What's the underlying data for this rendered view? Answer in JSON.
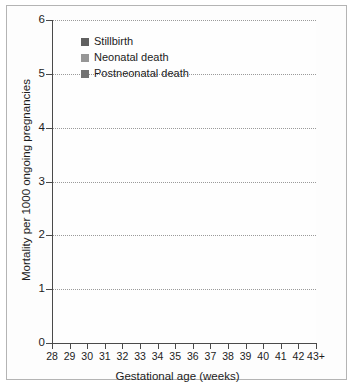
{
  "chart_data": {
    "type": "area",
    "stacked": true,
    "title": "",
    "xlabel": "Gestational age (weeks)",
    "ylabel": "Mortality per 1000 ongoing pregnancies",
    "categories": [
      "28",
      "29",
      "30",
      "31",
      "32",
      "33",
      "34",
      "35",
      "36",
      "37",
      "38",
      "39",
      "40",
      "41",
      "42",
      "43+"
    ],
    "x_tick_labels": [
      "28",
      "29",
      "30",
      "31",
      "32",
      "33",
      "34",
      "35",
      "36",
      "37",
      "38",
      "39",
      "40",
      "41",
      "42",
      "43+"
    ],
    "y_tick_labels": [
      "0",
      "1",
      "2",
      "3",
      "4",
      "5",
      "6"
    ],
    "y_ticks": [
      0,
      1,
      2,
      3,
      4,
      5,
      6
    ],
    "ylim": [
      0,
      6
    ],
    "grid": "horizontal-dotted",
    "legend_position": "top-left-inside",
    "series": [
      {
        "name": "Postneonatal death",
        "color": "#727272",
        "stack_order": 1,
        "values": [
          0.2,
          0.15,
          0.18,
          0.16,
          0.22,
          0.18,
          0.2,
          0.18,
          0.25,
          0.22,
          0.3,
          0.4,
          0.7,
          1.1,
          1.55,
          2.1
        ]
      },
      {
        "name": "Neonatal death",
        "color": "#969696",
        "stack_order": 2,
        "values": [
          0.22,
          0.14,
          0.22,
          0.18,
          0.25,
          0.2,
          0.24,
          0.2,
          0.3,
          0.22,
          0.38,
          0.5,
          0.75,
          0.75,
          1.05,
          1.5
        ]
      },
      {
        "name": "Stillbirth",
        "color": "#606060",
        "stack_order": 3,
        "values": [
          0.08,
          0.06,
          0.1,
          0.08,
          0.09,
          0.09,
          0.1,
          0.12,
          0.33,
          0.26,
          0.52,
          0.55,
          1.05,
          0.9,
          1.15,
          2.4
        ]
      }
    ],
    "cumulative_totals": [
      0.5,
      0.35,
      0.5,
      0.42,
      0.56,
      0.47,
      0.54,
      0.5,
      0.88,
      0.7,
      1.2,
      1.4,
      2.5,
      2.75,
      3.75,
      6.0
    ]
  },
  "legend": {
    "items": [
      {
        "label": "Stillbirth",
        "color": "#606060"
      },
      {
        "label": "Neonatal death",
        "color": "#969696"
      },
      {
        "label": "Postneonatal death",
        "color": "#727272"
      }
    ]
  }
}
